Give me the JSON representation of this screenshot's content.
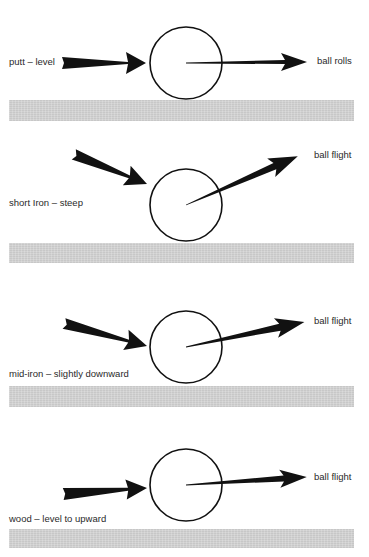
{
  "diagram": {
    "colors": {
      "background": "#ffffff",
      "ink": "#111111",
      "ground": "#d2d2d2",
      "text": "#2a2a2a"
    },
    "panels": [
      {
        "id": "putt",
        "club_label": "putt – level",
        "result_label": "ball rolls",
        "ball": {
          "cx": 186,
          "cy": 63,
          "r": 36
        },
        "incoming": {
          "from": [
            62,
            63
          ],
          "to": [
            146,
            63
          ]
        },
        "outgoing": {
          "from": [
            186,
            63
          ],
          "to": [
            307,
            62
          ]
        },
        "ground": {
          "top": 100,
          "height": 21
        }
      },
      {
        "id": "short-iron",
        "club_label": "short Iron – steep",
        "result_label": "ball flight",
        "ball": {
          "cx": 186,
          "cy": 205,
          "r": 36
        },
        "incoming": {
          "from": [
            74,
            155
          ],
          "to": [
            147,
            184
          ]
        },
        "outgoing": {
          "from": [
            186,
            205
          ],
          "to": [
            298,
            156
          ]
        },
        "ground": {
          "top": 243,
          "height": 20
        }
      },
      {
        "id": "mid-iron",
        "club_label": "mid-iron – slightly downward",
        "result_label": "ball flight",
        "ball": {
          "cx": 186,
          "cy": 347,
          "r": 36
        },
        "incoming": {
          "from": [
            64,
            324
          ],
          "to": [
            147,
            346
          ]
        },
        "outgoing": {
          "from": [
            186,
            347
          ],
          "to": [
            305,
            322
          ]
        },
        "ground": {
          "top": 386,
          "height": 21
        }
      },
      {
        "id": "wood",
        "club_label": "wood – level to upward",
        "result_label": "ball flight",
        "ball": {
          "cx": 186,
          "cy": 485,
          "r": 36
        },
        "incoming": {
          "from": [
            63,
            494
          ],
          "to": [
            147,
            488
          ]
        },
        "outgoing": {
          "from": [
            186,
            485
          ],
          "to": [
            307,
            477
          ]
        },
        "ground": {
          "top": 529,
          "height": 19
        }
      }
    ]
  }
}
